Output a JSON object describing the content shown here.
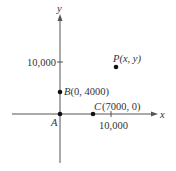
{
  "diagram": {
    "axes": {
      "x_label": "x",
      "y_label": "y",
      "x_tick_label": "10,000",
      "y_tick_label": "10,000",
      "origin_label": "A"
    },
    "points": [
      {
        "id": "A",
        "label": "A",
        "coords": ""
      },
      {
        "id": "B",
        "label": "B",
        "coords": "(0, 4000)"
      },
      {
        "id": "C",
        "label": "C",
        "coords": "(7000, 0)"
      },
      {
        "id": "P",
        "label": "P",
        "coords": "(x, y)"
      }
    ],
    "colors": {
      "axis": "#555555",
      "point": "#111111",
      "text": "#333333"
    }
  }
}
